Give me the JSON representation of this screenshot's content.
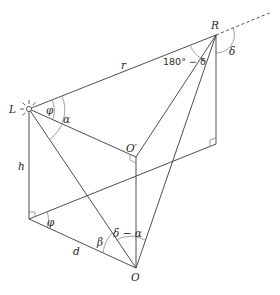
{
  "diagram": {
    "type": "geometry",
    "points": {
      "L": {
        "label": "L",
        "x": 29,
        "y": 109
      },
      "R": {
        "label": "R",
        "x": 216,
        "y": 35
      },
      "O": {
        "label": "O",
        "x": 136,
        "y": 268
      },
      "O_prime": {
        "label": "O′",
        "x": 136,
        "y": 157
      },
      "H": {
        "label": "",
        "x": 29,
        "y": 219
      },
      "Rfoot": {
        "label": "",
        "x": 216,
        "y": 144
      }
    },
    "labels": {
      "r": "r",
      "h": "h",
      "d": "d",
      "phi_top": "φ",
      "alpha": "α",
      "phi_bottom": "φ",
      "beta": "β",
      "delta_minus_alpha": "δ − α",
      "angle_at_R": "180° − δ",
      "delta": "δ"
    }
  }
}
